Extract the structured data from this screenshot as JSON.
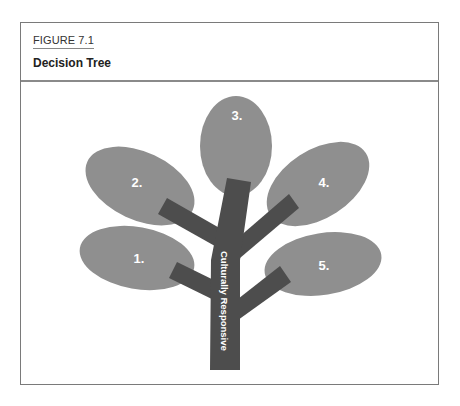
{
  "figure": {
    "label": "FIGURE 7.1",
    "title": "Decision Tree"
  },
  "colors": {
    "leaf": "#8f8f8f",
    "branch": "#4d4d4d",
    "frame": "#7a7a7a",
    "text_on_shape": "#ffffff"
  },
  "tree": {
    "trunk_label": "Culturally Responsive",
    "leaves": [
      {
        "label": "1."
      },
      {
        "label": "2."
      },
      {
        "label": "3."
      },
      {
        "label": "4."
      },
      {
        "label": "5."
      }
    ]
  }
}
